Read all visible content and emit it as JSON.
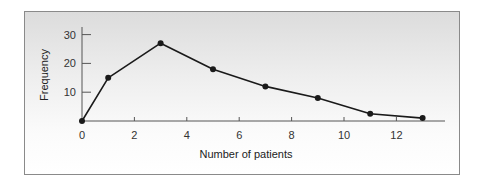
{
  "chart_data": {
    "type": "line",
    "title": "",
    "xlabel": "Number of patients",
    "ylabel": "Frequency",
    "x": [
      0,
      1,
      3,
      5,
      7,
      9,
      11,
      13
    ],
    "series": [
      {
        "name": "Frequency",
        "values": [
          0,
          15,
          27,
          18,
          12,
          8,
          2.5,
          1
        ]
      }
    ],
    "xticks": [
      0,
      2,
      4,
      6,
      8,
      10,
      12
    ],
    "yticks": [
      10,
      20,
      30
    ],
    "xlim": [
      0,
      14
    ],
    "ylim": [
      0,
      33
    ],
    "grid": false,
    "legend": "none",
    "markers": true,
    "colors": {
      "line": "#1a1a1a",
      "axis": "#555555",
      "background_top": "#dcdcdc",
      "background_bottom": "#ffffff"
    }
  },
  "labels": {
    "x_axis": "Number of patients",
    "y_axis": "Frequency",
    "xticks": [
      "0",
      "2",
      "4",
      "6",
      "8",
      "10",
      "12"
    ],
    "yticks": [
      "10",
      "20",
      "30"
    ]
  }
}
